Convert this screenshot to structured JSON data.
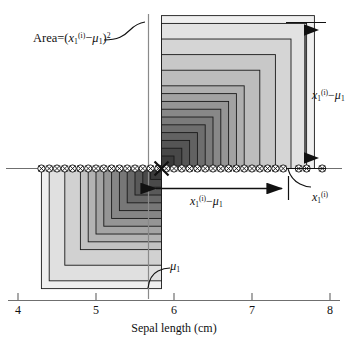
{
  "chart_data": {
    "type": "scatter",
    "title": "",
    "xlabel": "Sepal length (cm)",
    "ylabel": "",
    "xlim": [
      4,
      8
    ],
    "xticks": [
      4,
      5,
      6,
      7,
      8
    ],
    "xticklabels": [
      "4",
      "5",
      "6",
      "7",
      "8"
    ],
    "grid": false,
    "legend": null,
    "mu1": 5.84,
    "x1_i": 7.8,
    "marker": "circle-with-x",
    "baseline_value": 0,
    "x": [
      4.3,
      4.4,
      4.5,
      4.6,
      4.7,
      4.8,
      4.9,
      5.0,
      5.1,
      5.2,
      5.3,
      5.4,
      5.5,
      5.6,
      5.7,
      5.8,
      5.9,
      6.0,
      6.1,
      6.2,
      6.3,
      6.4,
      6.5,
      6.6,
      6.7,
      6.8,
      6.9,
      7.0,
      7.1,
      7.2,
      7.3,
      7.4,
      7.6,
      7.7,
      7.9
    ],
    "squares_upper_right": {
      "anchor_x": 5.84,
      "side_values": [
        0.16,
        0.26,
        0.36,
        0.46,
        0.56,
        0.66,
        0.76,
        0.86,
        0.96,
        1.06,
        1.26,
        1.46,
        1.66,
        1.86,
        1.96
      ],
      "description": "nested squares above axis, right of mu1, each side = x1(i) - mu1"
    },
    "squares_lower_left": {
      "anchor_x": 5.84,
      "side_values": [
        0.14,
        0.24,
        0.34,
        0.44,
        0.54,
        0.64,
        0.74,
        0.84,
        0.94,
        1.04,
        1.24,
        1.44,
        1.54
      ],
      "description": "nested squares below axis, left of mu1, each side = mu1 - x1(i)"
    },
    "annotations": [
      {
        "name": "area-label",
        "text": "Area = (x1(i) - mu1)^2"
      },
      {
        "name": "vertical-extent-label",
        "text": "x1(i) - mu1"
      },
      {
        "name": "horizontal-extent-label",
        "text": "x1(i) - mu1"
      },
      {
        "name": "mu-label",
        "text": "mu1"
      },
      {
        "name": "xi-label",
        "text": "x1(i)"
      }
    ]
  },
  "figure": {
    "axis": {
      "label": "Sepal length (cm)",
      "ticks": [
        {
          "value": "4"
        },
        {
          "value": "5"
        },
        {
          "value": "6"
        },
        {
          "value": "7"
        },
        {
          "value": "8"
        }
      ]
    },
    "labels": {
      "area_prefix": "Area",
      "area_eq": "=",
      "area_open": "(",
      "var_x": "x",
      "var_sub": "1",
      "var_sup": "(i)",
      "minus": "−",
      "var_mu": "μ",
      "mu_sub": "1",
      "area_close": ")",
      "area_pow": "2",
      "mu_only": "μ",
      "mu_only_sub": "1"
    },
    "colors": {
      "background": "#ffffff",
      "axis_line": "#6f6f6f",
      "ink": "#111111",
      "square_darkest": "#3b3b3b",
      "square_lightest": "#efefef"
    }
  }
}
